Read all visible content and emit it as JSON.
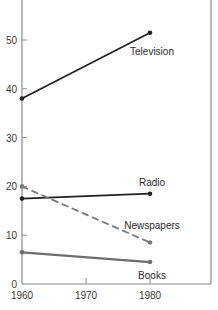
{
  "chart_data": {
    "type": "line",
    "title": "",
    "xlabel": "",
    "ylabel": "",
    "x": [
      1960,
      1980
    ],
    "xlim": [
      1960,
      1989
    ],
    "ylim": [
      0,
      58
    ],
    "x_ticks": [
      1960,
      1970,
      1980
    ],
    "y_ticks": [
      0,
      10,
      20,
      30,
      40,
      50
    ],
    "grid": false,
    "legend": "none (direct labels near 1980 endpoints)",
    "series": [
      {
        "name": "Television",
        "values": [
          38,
          51.5
        ],
        "color": "#222222",
        "style": "solid"
      },
      {
        "name": "Radio",
        "values": [
          17.5,
          18.5
        ],
        "color": "#222222",
        "style": "solid"
      },
      {
        "name": "Newspapers",
        "values": [
          20,
          8.5
        ],
        "color": "#7a7a7a",
        "style": "dashed"
      },
      {
        "name": "Books",
        "values": [
          6.5,
          4.5
        ],
        "color": "#6e6e6e",
        "style": "solid"
      }
    ]
  }
}
